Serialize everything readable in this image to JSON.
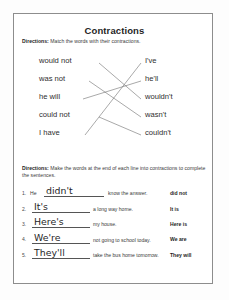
{
  "worksheet": {
    "title": "Contractions"
  },
  "match_section": {
    "directions_label": "Directions:",
    "directions_text": " Match the words with their contractions.",
    "left_words": [
      "would not",
      "was not",
      "he will",
      "could not",
      "I have"
    ],
    "right_words": [
      "I've",
      "he'll",
      "wouldn't",
      "wasn't",
      "couldn't"
    ],
    "connections": [
      {
        "from": 0,
        "to": 2
      },
      {
        "from": 1,
        "to": 3
      },
      {
        "from": 2,
        "to": 1
      },
      {
        "from": 3,
        "to": 4
      },
      {
        "from": 4,
        "to": 0
      }
    ]
  },
  "fill_section": {
    "directions_label": "Directions:",
    "directions_text": " Make the words at the end of each line into contractions to complete the sentences.",
    "rows": [
      {
        "number": "1.",
        "before": "He",
        "answer": "didn't",
        "after": "know the answer.",
        "cue": "did not"
      },
      {
        "number": "2.",
        "before": "",
        "answer": "It's",
        "after": "a long way home.",
        "cue": "It is"
      },
      {
        "number": "3.",
        "before": "",
        "answer": "Here's",
        "after": "my house.",
        "cue": "Here is"
      },
      {
        "number": "4.",
        "before": "",
        "answer": "We're",
        "after": "not going to school today.",
        "cue": "We are"
      },
      {
        "number": "5.",
        "before": "",
        "answer": "They'll",
        "after": "take the bus home tomorrow.",
        "cue": "They will"
      }
    ]
  },
  "colors": {
    "border": "#8d8d8d",
    "text": "#2b2b2b",
    "line": "#6e6e6e"
  }
}
